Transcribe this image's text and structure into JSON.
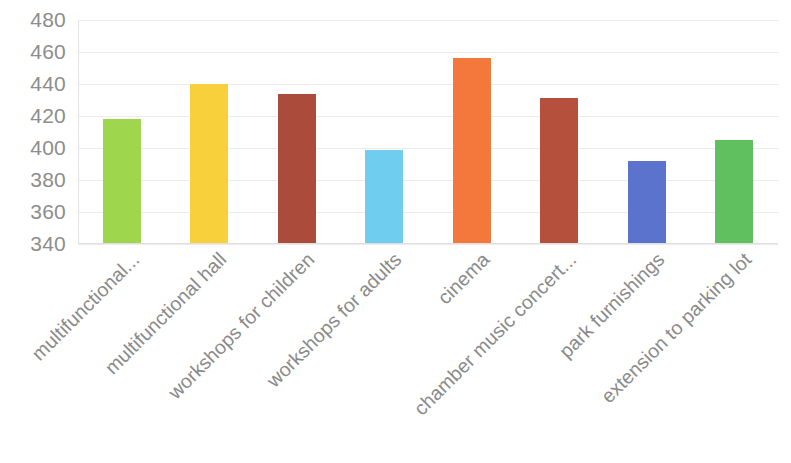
{
  "chart_data": {
    "type": "bar",
    "title": "",
    "subtitle": "",
    "xlabel": "",
    "ylabel": "",
    "ylim": [
      340,
      480
    ],
    "ytick_step": 20,
    "yticks": [
      480,
      460,
      440,
      420,
      400,
      380,
      360,
      340
    ],
    "ytick_labels": [
      "480",
      "460",
      "440",
      "420",
      "400",
      "380",
      "360",
      "340"
    ],
    "grid": true,
    "grid_axis": "y",
    "legend": false,
    "legend_position": "none",
    "categories": [
      "multifunctional...",
      "multifunctional hall",
      "workshops for children",
      "workshops for adults",
      "cinema",
      "chamber music concert...",
      "park furnishings",
      "extension to parking lot"
    ],
    "values": [
      418,
      440,
      434,
      399,
      456,
      431,
      392,
      405
    ],
    "colors": [
      "#9ed64d",
      "#f8d03c",
      "#ab4b3c",
      "#6fcdf0",
      "#f4783c",
      "#b4503c",
      "#5c73ce",
      "#60c060"
    ]
  }
}
